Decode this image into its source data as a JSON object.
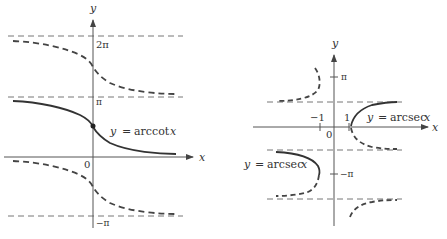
{
  "left_graph": {
    "y_axis_label": "y",
    "x_axis_label": "x",
    "origin_label": "0",
    "ticks": {
      "two_pi": "2π",
      "pi": "π",
      "neg_pi": "−π"
    },
    "curve_label_lhs": "y",
    "curve_label_eq": "=",
    "curve_label_fn": "arccot",
    "curve_label_var": "x"
  },
  "right_graph": {
    "y_axis_label": "y",
    "x_axis_label": "x",
    "origin_label": "0",
    "ticks": {
      "pi": "π",
      "neg_pi": "−π",
      "neg_one": "−1",
      "one": "1"
    },
    "upper_label_lhs": "y",
    "upper_label_eq": "=",
    "upper_label_fn": "arcsec",
    "upper_label_var": "x",
    "lower_label_lhs": "y",
    "lower_label_eq": "=",
    "lower_label_fn": "arcsec",
    "lower_label_var": "x"
  },
  "colors": {
    "ink": "#333333",
    "dash": "#444444",
    "axis": "#555555"
  }
}
